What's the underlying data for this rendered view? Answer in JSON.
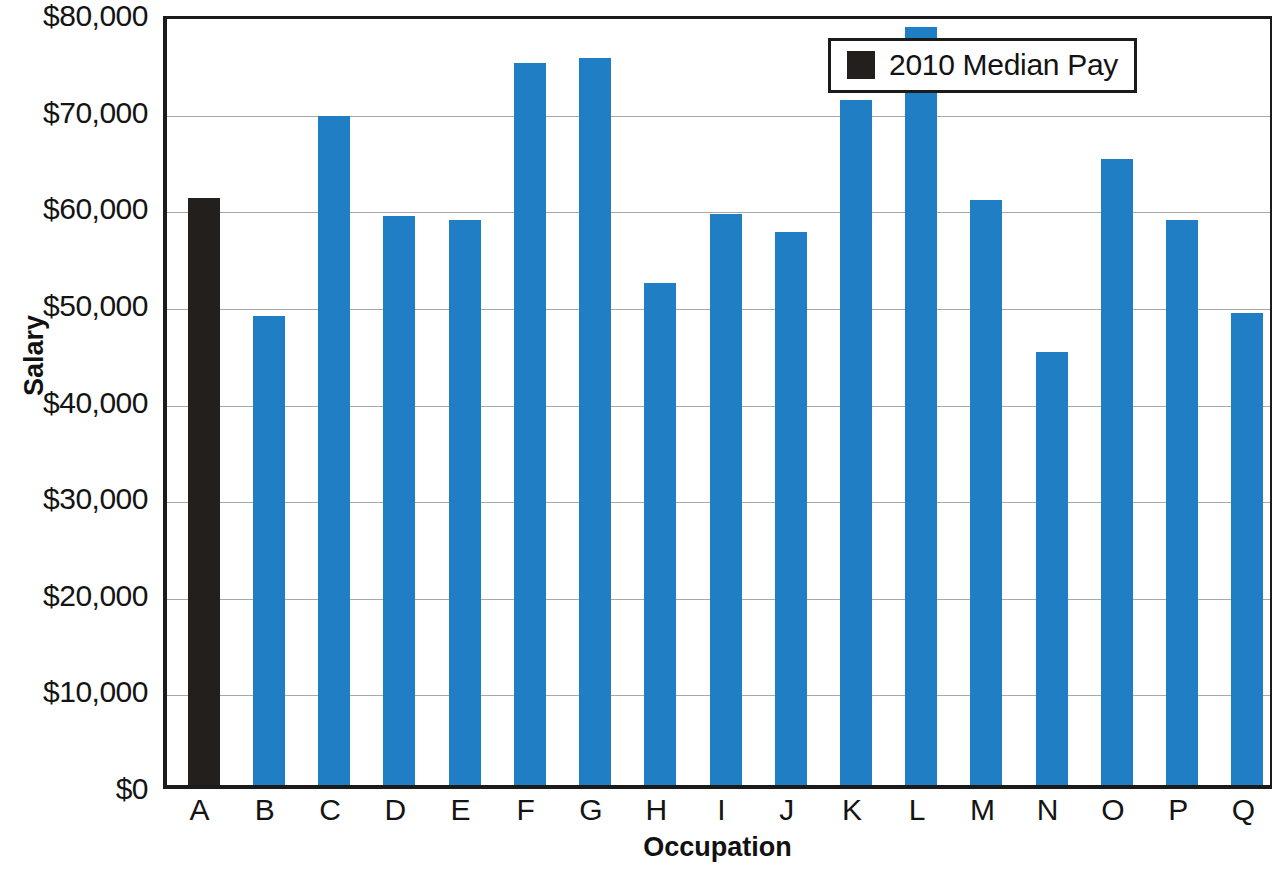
{
  "chart_data": {
    "type": "bar",
    "title": "",
    "subtitle": "",
    "xlabel": "Occupation",
    "ylabel": "Salary",
    "categories": [
      "A",
      "B",
      "C",
      "D",
      "E",
      "F",
      "G",
      "H",
      "I",
      "J",
      "K",
      "L",
      "M",
      "N",
      "O",
      "P",
      "Q"
    ],
    "values": [
      60800,
      48500,
      69200,
      58900,
      58500,
      74700,
      75200,
      52000,
      59100,
      57200,
      70900,
      78400,
      60500,
      44800,
      64800,
      58500,
      48800
    ],
    "series": [
      {
        "name": "2010 Median Pay",
        "values": [
          60800,
          48500,
          69200,
          58900,
          58500,
          74700,
          75200,
          52000,
          59100,
          57200,
          70900,
          78400,
          60500,
          44800,
          64800,
          58500,
          48800
        ]
      }
    ],
    "ylim": [
      0,
      80000
    ],
    "ytick_values": [
      0,
      10000,
      20000,
      30000,
      40000,
      50000,
      60000,
      70000,
      80000
    ],
    "ytick_labels": [
      "$0",
      "$10,000",
      "$20,000",
      "$30,000",
      "$40,000",
      "$50,000",
      "$60,000",
      "$70,000",
      "$80,000"
    ],
    "xtick_labels": [
      "A",
      "B",
      "C",
      "D",
      "E",
      "F",
      "G",
      "H",
      "I",
      "J",
      "K",
      "L",
      "M",
      "N",
      "O",
      "P",
      "Q"
    ],
    "grid": true,
    "grid_axis": "y",
    "legend": {
      "position": "top-right",
      "entries": [
        {
          "label": "2010 Median Pay",
          "color": "#231f1c"
        }
      ]
    },
    "bar_colors": [
      "#231f1c",
      "#1f7ec4",
      "#1f7ec4",
      "#1f7ec4",
      "#1f7ec4",
      "#1f7ec4",
      "#1f7ec4",
      "#1f7ec4",
      "#1f7ec4",
      "#1f7ec4",
      "#1f7ec4",
      "#1f7ec4",
      "#1f7ec4",
      "#1f7ec4",
      "#1f7ec4",
      "#1f7ec4",
      "#1f7ec4"
    ],
    "colors": {
      "highlight_bar": "#231f1c",
      "default_bar": "#1f7ec4",
      "gridline": "#a8a8a8",
      "axis": "#1b1b1b",
      "text": "#141414",
      "background": "#ffffff"
    }
  }
}
